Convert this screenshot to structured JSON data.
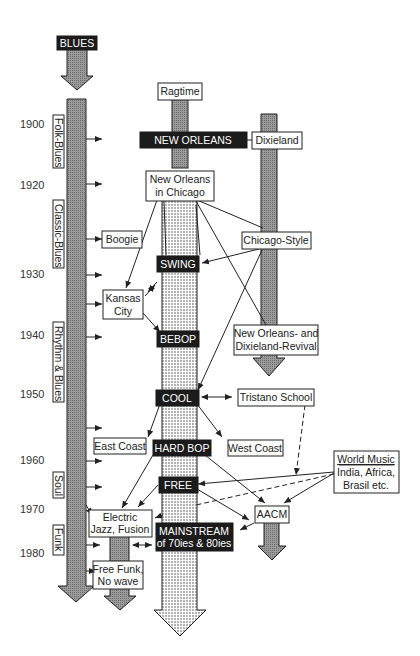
{
  "diagram": {
    "years": [
      "1900",
      "1920",
      "1930",
      "1940",
      "1950",
      "1960",
      "1970",
      "1980"
    ],
    "blues_strand": {
      "head_label": "BLUES",
      "eras": [
        "Folk-Blues",
        "Classic-Blues",
        "Rhythm & Blues",
        "Soul",
        "Funk"
      ]
    },
    "main_styles": {
      "new_orleans": "NEW ORLEANS",
      "swing": "SWING",
      "bebop": "BEBOP",
      "cool": "COOL",
      "hard_bop": "HARD BOP",
      "free": "FREE",
      "mainstream_line1": "MAINSTREAM",
      "mainstream_line2": "of 70ies & 80ies"
    },
    "side_styles": {
      "ragtime": "Ragtime",
      "dixieland": "Dixieland",
      "no_chicago_line1": "New Orleans",
      "no_chicago_line2": "in Chicago",
      "boogie": "Boogie",
      "chicago_style": "Chicago-Style",
      "kansas_line1": "Kansas",
      "kansas_line2": "City",
      "revival_line1": "New Orleans- and",
      "revival_line2": "Dixieland-Revival",
      "tristano": "Tristano School",
      "east_coast": "East Coast",
      "west_coast": "West Coast",
      "world_line1": "World Music",
      "world_line2": "India, Africa,",
      "world_line3": "Brasil etc.",
      "aacm": "AACM",
      "fusion_line1": "Electric",
      "fusion_line2": "Jazz, Fusion",
      "funk_line1": "Free Funk,",
      "funk_line2": "No wave"
    },
    "colors": {
      "ink": "#1b1b1b",
      "paper": "#ffffff",
      "stipple": "#9a9a9a"
    }
  }
}
